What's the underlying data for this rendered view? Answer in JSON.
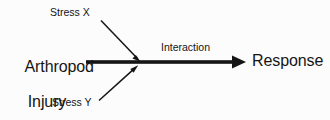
{
  "diagram": {
    "background_color": "#fcfcfc",
    "stroke_color": "#151515",
    "text_color": "#151515",
    "nodes": {
      "source": {
        "label_line1": "Arthropod",
        "label_line2": "Injury",
        "role": "input"
      },
      "target": {
        "label": "Response",
        "role": "output"
      },
      "stress_x": {
        "label": "Stress X",
        "role": "modifier"
      },
      "stress_y": {
        "label": "Stress Y",
        "role": "modifier"
      }
    },
    "edges": {
      "main": {
        "label": "Interaction",
        "from": "source",
        "to": "target",
        "style": "thick-solid-arrow"
      },
      "stress_x_edge": {
        "from": "stress_x",
        "to": "main",
        "style": "thin-solid-arrow"
      },
      "stress_y_edge": {
        "from": "stress_y",
        "to": "main",
        "style": "thin-solid-arrow"
      }
    }
  }
}
